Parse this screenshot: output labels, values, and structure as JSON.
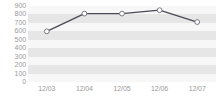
{
  "chart_data": {
    "type": "line",
    "title": "",
    "subtitle": "",
    "xlabel": "",
    "ylabel": "",
    "categories": [
      "12/03",
      "12/04",
      "12/05",
      "12/06",
      "12/07"
    ],
    "values": [
      600,
      810,
      810,
      850,
      710
    ],
    "series": [
      {
        "name": "series-1",
        "values": [
          600,
          810,
          810,
          850,
          710
        ]
      }
    ],
    "ylim": [
      0,
      900
    ],
    "ytick_step": 100,
    "ytick_labels": [
      "900",
      "800",
      "700",
      "600",
      "500",
      "400",
      "300",
      "200",
      "100",
      "0"
    ],
    "ytick_values": [
      900,
      800,
      700,
      600,
      500,
      400,
      300,
      200,
      100,
      0
    ],
    "xtick_labels": [
      "12/03",
      "12/04",
      "12/05",
      "12/06",
      "12/07"
    ],
    "grid": "horizontal-alternating-bands",
    "legend": "none",
    "legend_position": "none",
    "marker": "open-circle",
    "colors": {
      "line": "#4a4a55",
      "marker_fill": "#ffffff",
      "marker_stroke": "#7a7a86",
      "band_shaded": "#e6e6e6",
      "band_plain": "#f7f7f7",
      "tick_label": "#9a9a9a",
      "background": "#ffffff"
    }
  }
}
